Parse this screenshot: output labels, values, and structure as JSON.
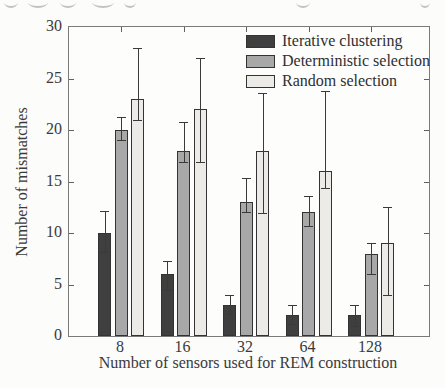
{
  "figure": {
    "type": "scanned-paper-figure"
  },
  "chart_data": {
    "type": "bar",
    "title": "",
    "xlabel": "Number of sensors used for REM construction",
    "ylabel": "Number of mismatches",
    "categories": [
      "8",
      "16",
      "32",
      "64",
      "128"
    ],
    "ylim": [
      0,
      30
    ],
    "yticks": [
      0,
      5,
      10,
      15,
      20,
      25,
      30
    ],
    "grid": false,
    "legend_position": "top-right-inside",
    "error_bars": true,
    "axis_color": "#7a7a7a",
    "series": [
      {
        "name": "Iterative clustering",
        "color": "#3f3f3f",
        "values": [
          10,
          6,
          3,
          2,
          2
        ],
        "error_low": [
          8.2,
          4.5,
          2.1,
          1.2,
          1.0
        ],
        "error_high": [
          12.1,
          7.3,
          4.0,
          3.0,
          3.0
        ]
      },
      {
        "name": "Deterministic selection",
        "color": "#a8a8a8",
        "values": [
          20,
          18,
          13,
          12,
          8
        ],
        "error_low": [
          19.0,
          16.9,
          12.0,
          10.7,
          6.0
        ],
        "error_high": [
          21.3,
          20.8,
          15.3,
          13.6,
          9.0
        ]
      },
      {
        "name": "Random selection",
        "color": "#edebe7",
        "values": [
          23,
          22,
          18,
          16,
          9
        ],
        "error_low": [
          21.0,
          16.9,
          11.9,
          14.4,
          4.0
        ],
        "error_high": [
          28.0,
          27.0,
          23.6,
          23.8,
          12.5
        ]
      }
    ]
  }
}
